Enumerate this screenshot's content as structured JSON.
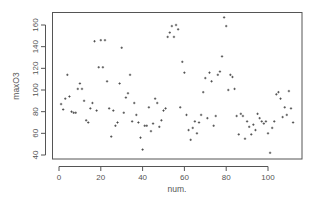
{
  "chart_data": {
    "type": "scatter",
    "title": "",
    "xlabel": "num.",
    "ylabel": "maxO3",
    "xlim": [
      -3,
      115
    ],
    "ylim": [
      38,
      170
    ],
    "x_ticks": [
      0,
      20,
      40,
      60,
      80,
      100
    ],
    "y_ticks": [
      40,
      60,
      80,
      100,
      120,
      140,
      160
    ],
    "grid": false,
    "legend": null,
    "marker": "+",
    "colors": {
      "axis": "#555555",
      "points": "#333333",
      "background": "#ffffff"
    },
    "points": [
      [
        1,
        87
      ],
      [
        2,
        82
      ],
      [
        3,
        92
      ],
      [
        4,
        114
      ],
      [
        5,
        94
      ],
      [
        6,
        80
      ],
      [
        7,
        79
      ],
      [
        8,
        79
      ],
      [
        9,
        101
      ],
      [
        10,
        106
      ],
      [
        11,
        101
      ],
      [
        12,
        90
      ],
      [
        13,
        72
      ],
      [
        14,
        70
      ],
      [
        15,
        83
      ],
      [
        16,
        88
      ],
      [
        17,
        145
      ],
      [
        18,
        81
      ],
      [
        19,
        121
      ],
      [
        20,
        146
      ],
      [
        21,
        121
      ],
      [
        22,
        146
      ],
      [
        23,
        108
      ],
      [
        24,
        83
      ],
      [
        25,
        57
      ],
      [
        26,
        81
      ],
      [
        27,
        67
      ],
      [
        28,
        70
      ],
      [
        29,
        106
      ],
      [
        30,
        139
      ],
      [
        31,
        79
      ],
      [
        32,
        93
      ],
      [
        33,
        97
      ],
      [
        34,
        114
      ],
      [
        35,
        71
      ],
      [
        36,
        88
      ],
      [
        37,
        77
      ],
      [
        38,
        70
      ],
      [
        39,
        56
      ],
      [
        40,
        45
      ],
      [
        41,
        67
      ],
      [
        42,
        67
      ],
      [
        43,
        84
      ],
      [
        44,
        62
      ],
      [
        45,
        69
      ],
      [
        46,
        92
      ],
      [
        47,
        88
      ],
      [
        48,
        66
      ],
      [
        49,
        72
      ],
      [
        50,
        81
      ],
      [
        51,
        83
      ],
      [
        52,
        149
      ],
      [
        53,
        153
      ],
      [
        54,
        159
      ],
      [
        55,
        149
      ],
      [
        56,
        160
      ],
      [
        57,
        156
      ],
      [
        58,
        84
      ],
      [
        59,
        126
      ],
      [
        60,
        116
      ],
      [
        61,
        77
      ],
      [
        62,
        63
      ],
      [
        63,
        54
      ],
      [
        64,
        65
      ],
      [
        65,
        71
      ],
      [
        66,
        60
      ],
      [
        67,
        70
      ],
      [
        68,
        77
      ],
      [
        69,
        98
      ],
      [
        70,
        111
      ],
      [
        71,
        74
      ],
      [
        72,
        116
      ],
      [
        73,
        108
      ],
      [
        74,
        67
      ],
      [
        75,
        76
      ],
      [
        76,
        114
      ],
      [
        77,
        117
      ],
      [
        78,
        131
      ],
      [
        79,
        167
      ],
      [
        80,
        159
      ],
      [
        81,
        100
      ],
      [
        82,
        114
      ],
      [
        83,
        112
      ],
      [
        84,
        101
      ],
      [
        85,
        76
      ],
      [
        86,
        59
      ],
      [
        87,
        78
      ],
      [
        88,
        76
      ],
      [
        89,
        55
      ],
      [
        90,
        71
      ],
      [
        91,
        66
      ],
      [
        92,
        59
      ],
      [
        93,
        68
      ],
      [
        94,
        63
      ],
      [
        95,
        78
      ],
      [
        96,
        74
      ],
      [
        97,
        71
      ],
      [
        98,
        69
      ],
      [
        99,
        71
      ],
      [
        100,
        60
      ],
      [
        101,
        42
      ],
      [
        102,
        65
      ],
      [
        103,
        71
      ],
      [
        104,
        96
      ],
      [
        105,
        98
      ],
      [
        106,
        92
      ],
      [
        107,
        75
      ],
      [
        108,
        84
      ],
      [
        109,
        77
      ],
      [
        110,
        99
      ],
      [
        111,
        83
      ],
      [
        112,
        70
      ]
    ]
  }
}
